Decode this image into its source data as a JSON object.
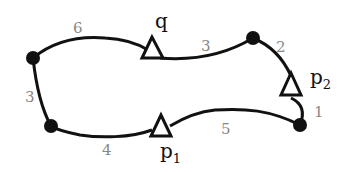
{
  "diagram": {
    "type": "weighted cycle graph",
    "nodes": [
      {
        "id": "n_left_top",
        "x": 33,
        "y": 58
      },
      {
        "id": "n_top_right",
        "x": 253,
        "y": 38
      },
      {
        "id": "n_left_bottom",
        "x": 51,
        "y": 126
      },
      {
        "id": "n_right_bottom",
        "x": 300,
        "y": 125
      }
    ],
    "markers": [
      {
        "id": "q",
        "label": "q",
        "subscript": "",
        "x": 152,
        "y": 50
      },
      {
        "id": "p2",
        "label": "p",
        "subscript": "2",
        "x": 291,
        "y": 88
      },
      {
        "id": "p1",
        "label": "p",
        "subscript": "1",
        "x": 161,
        "y": 128
      }
    ],
    "edge_weights": {
      "left_top_to_q": "6",
      "q_to_top_right": "3",
      "top_right_to_p2": "2",
      "p2_to_right_bottom": "1",
      "right_bottom_to_p1": "5",
      "p1_to_left_bottom": "4",
      "left_bottom_to_left_top": "3"
    }
  }
}
